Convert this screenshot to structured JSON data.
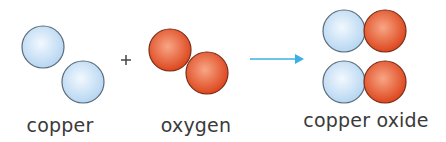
{
  "diagram": {
    "type": "chemical-reaction",
    "operator": "+",
    "arrow": "→",
    "reactants": [
      {
        "name": "copper",
        "label": "copper",
        "atoms": 2,
        "color": "#c8e2f7"
      },
      {
        "name": "oxygen",
        "label": "oxygen",
        "atoms": 2,
        "color": "#e9552b"
      }
    ],
    "products": [
      {
        "name": "copper oxide",
        "label": "copper oxide",
        "units": 2
      }
    ],
    "colors": {
      "copper_fill_light": "#eaf4fd",
      "copper_fill_dark": "#b9d8f2",
      "copper_stroke": "#5a6a78",
      "oxygen_fill_light": "#f7a07c",
      "oxygen_fill_dark": "#df4a20",
      "oxygen_stroke": "#7a2e18",
      "arrow": "#3bb0e3",
      "text": "#3a3a3a"
    }
  }
}
